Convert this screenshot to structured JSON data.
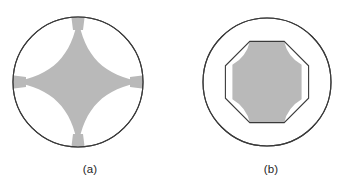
{
  "figure": {
    "background_color": "#ffffff",
    "outline_color": "#3a3a3a",
    "shade_color": "#b9b9b9",
    "caption_color": "#242424"
  },
  "panels": [
    {
      "id": "a",
      "caption": "(a)",
      "description": "Shaded astroid (four-cusped hypocycloid) inscribed in a circle; four white lunes remain between the concave arms and the circle.",
      "outer_circle": {
        "cx": 78,
        "cy": 82,
        "r": 65
      },
      "inner_shape": "astroid",
      "cusp_points": [
        {
          "name": "top",
          "x": 78,
          "y": 17
        },
        {
          "name": "right",
          "x": 143,
          "y": 82
        },
        {
          "name": "bottom",
          "x": 78,
          "y": 147
        },
        {
          "name": "left",
          "x": 13,
          "y": 82
        }
      ],
      "arm_half_width": 7,
      "white_lune_count": 4
    },
    {
      "id": "b",
      "caption": "(b)",
      "description": "Regular octagon inscribed inside a larger circle; a shaded region fills the octagon with its four diagonal edges bowed inward leaving white corner lunes.",
      "outer_circle": {
        "cx": 86,
        "cy": 82,
        "r": 64
      },
      "inner_shape": "octagon",
      "octagon": {
        "cx": 86,
        "cy": 82,
        "r": 45,
        "sides": 8,
        "rotation_deg": 22.5
      },
      "shaded_flat_edges": [
        "top",
        "right",
        "bottom",
        "left"
      ],
      "shaded_concave_edges": [
        "top-left",
        "top-right",
        "bottom-right",
        "bottom-left"
      ],
      "white_lune_count": 4
    }
  ],
  "captions": {
    "a": "(a)",
    "b": "(b)"
  }
}
